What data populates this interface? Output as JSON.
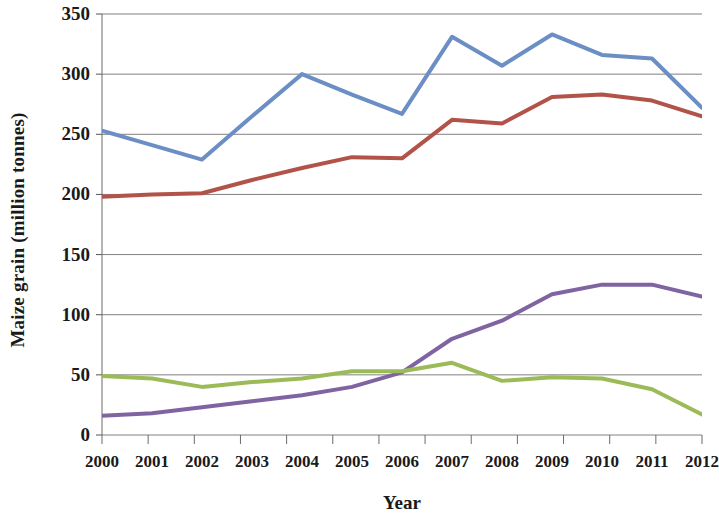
{
  "chart_data": {
    "type": "line",
    "title": "",
    "subtitle": "",
    "xlabel": "Year",
    "ylabel": "Maize grain (million tonnes)",
    "categories": [
      "2000",
      "2001",
      "2002",
      "2003",
      "2004",
      "2005",
      "2006",
      "2007",
      "2008",
      "2009",
      "2010",
      "2011",
      "2012"
    ],
    "x": [
      2000,
      2001,
      2002,
      2003,
      2004,
      2005,
      2006,
      2007,
      2008,
      2009,
      2010,
      2011,
      2012
    ],
    "ylim": [
      0,
      350
    ],
    "xlim": [
      2000,
      2012
    ],
    "yticks": [
      0,
      50,
      100,
      150,
      200,
      250,
      300,
      350
    ],
    "ytick_labels": [
      "0",
      "50",
      "100",
      "150",
      "200",
      "250",
      "300",
      "350"
    ],
    "grid": "horizontal",
    "legend": "none",
    "series": [
      {
        "name": "series-blue",
        "color": "#6b8ec4",
        "values": [
          253,
          241,
          229,
          265,
          300,
          283,
          267,
          331,
          307,
          333,
          316,
          313,
          272
        ]
      },
      {
        "name": "series-red",
        "color": "#b2534a",
        "values": [
          198,
          200,
          201,
          212,
          222,
          231,
          230,
          262,
          259,
          281,
          283,
          278,
          265
        ]
      },
      {
        "name": "series-purple",
        "color": "#8064a2",
        "values": [
          16,
          18,
          23,
          28,
          33,
          40,
          52,
          80,
          95,
          117,
          125,
          125,
          115
        ]
      },
      {
        "name": "series-green",
        "color": "#9bbb59",
        "values": [
          49,
          47,
          40,
          44,
          47,
          53,
          53,
          60,
          45,
          48,
          47,
          38,
          17
        ]
      }
    ]
  },
  "axes": {
    "y_title": "Maize grain (million tonnes)",
    "x_title": "Year"
  }
}
